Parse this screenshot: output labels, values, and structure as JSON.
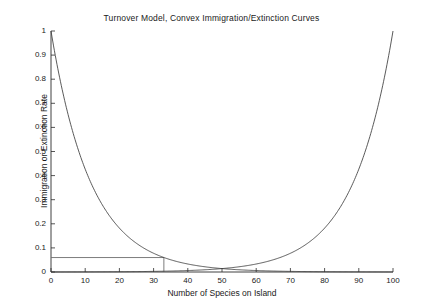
{
  "chart_data": {
    "type": "line",
    "title": "Turnover Model, Convex Immigration/Extinction Curves",
    "xlabel": "Number of Species on Island",
    "ylabel": "Immigration or Extinction Rate",
    "xlim": [
      0,
      100
    ],
    "ylim": [
      0,
      1
    ],
    "xticks": [
      0,
      10,
      20,
      30,
      40,
      50,
      60,
      70,
      80,
      90,
      100
    ],
    "xtick_labels": [
      "0",
      "10",
      "20",
      "30",
      "40",
      "50",
      "60",
      "70",
      "80",
      "90",
      "100"
    ],
    "yticks": [
      0,
      0.1,
      0.2,
      0.3,
      0.4,
      0.5,
      0.6,
      0.7,
      0.8,
      0.9,
      1
    ],
    "ytick_labels": [
      "0",
      "0.1",
      "0.2",
      "0.3",
      "0.4",
      "0.5",
      "0.6",
      "0.7",
      "0.8",
      "0.9",
      "1"
    ],
    "grid": false,
    "legend": "none",
    "line_color": "#3c3c3c",
    "marker_color": "#6e6e6e",
    "axis_color": "#2b2b2b",
    "background": "#ffffff",
    "x": [
      0,
      5,
      10,
      15,
      20,
      25,
      30,
      35,
      40,
      45,
      50,
      55,
      60,
      65,
      70,
      75,
      80,
      85,
      90,
      95,
      100
    ],
    "series": [
      {
        "name": "Immigration rate",
        "shape": "convex-decreasing",
        "values": [
          1.0,
          0.654,
          0.426,
          0.279,
          0.182,
          0.119,
          0.078,
          0.051,
          0.033,
          0.022,
          0.014,
          0.009,
          0.006,
          0.004,
          0.0026,
          0.0017,
          0.0011,
          0.0007,
          0.0005,
          0.0003,
          0.0002
        ]
      },
      {
        "name": "Extinction rate",
        "shape": "convex-increasing",
        "values": [
          0.0002,
          0.0003,
          0.0005,
          0.0007,
          0.0011,
          0.0017,
          0.0026,
          0.004,
          0.006,
          0.009,
          0.014,
          0.022,
          0.033,
          0.051,
          0.078,
          0.119,
          0.182,
          0.279,
          0.426,
          0.654,
          1.0
        ]
      }
    ],
    "equilibrium": {
      "label": "intersection",
      "x": 33,
      "y": 0.06,
      "guide_lines": [
        "horizontal-to-y-axis",
        "vertical-to-x-axis"
      ]
    }
  }
}
